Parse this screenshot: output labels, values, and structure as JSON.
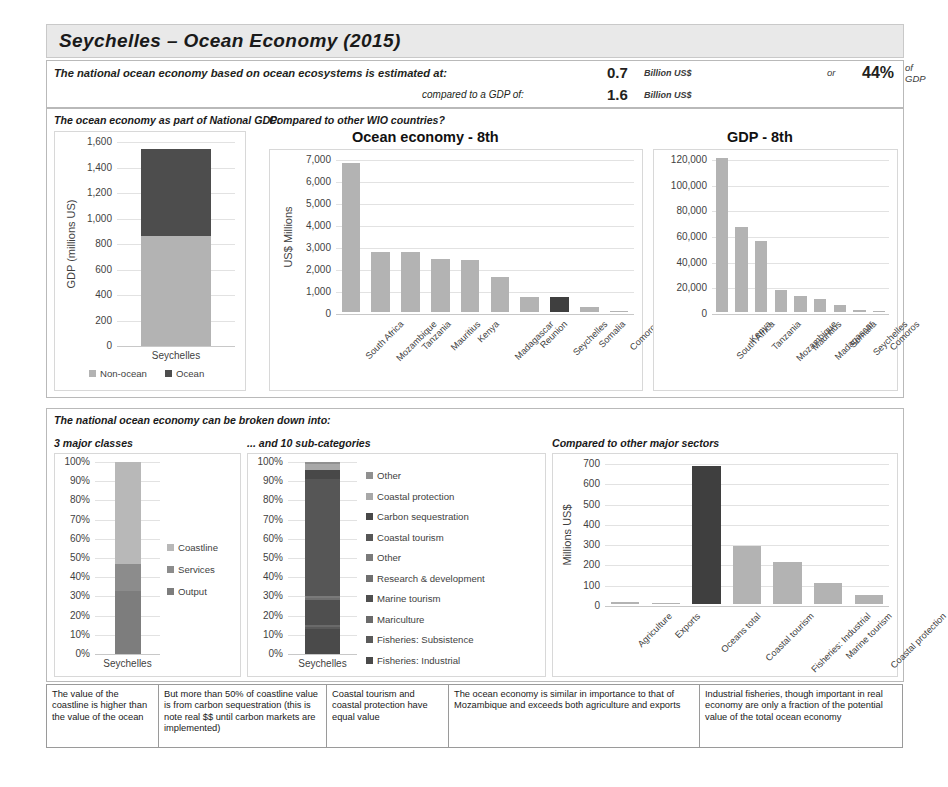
{
  "header": {
    "title": "Seychelles  –  Ocean Economy (2015)"
  },
  "summary": {
    "line1_label": "The national ocean economy based on ocean ecosystems is estimated at:",
    "line1_value": "0.7",
    "line1_unit": "Billion US$",
    "line2_label": "compared to a GDP of:",
    "line2_value": "1.6",
    "line2_unit": "Billion US$",
    "or_label": "or",
    "pct_value": "44%",
    "pct_unit": "of GDP"
  },
  "top_section": {
    "left_header": "The ocean economy as part of National GDP:",
    "right_header": "Compared to other WIO countries?"
  },
  "bottom_section": {
    "header": "The national ocean economy can be broken down into:",
    "col1_header": "3 major classes",
    "col2_header": "... and 10 sub-categories",
    "col3_header": "Compared to other major sectors"
  },
  "notes": [
    {
      "text": "The value of the coastline is higher than the value of the ocean",
      "width": 112
    },
    {
      "text": "But more than 50% of coastline value is from carbon sequestration (this is note real $$ until carbon markets are implemented)",
      "width": 168
    },
    {
      "text": "Coastal tourism and coastal protection have equal value",
      "width": 122
    },
    {
      "text": "The ocean economy is similar in importance to that of Mozambique and exceeds both agriculture and exports",
      "width": 251
    },
    {
      "text": "Industrial fisheries, though important in real economy are only a fraction of the potential value of the total ocean economy",
      "width": 203
    }
  ],
  "colors": {
    "light": "#b3b3b3",
    "mid": "#8f8f8f",
    "dark": "#4d4d4d",
    "darker": "#3a3a3a",
    "highlight": "#3f3f3f",
    "verylight": "#c9c9c9"
  },
  "chart_data": [
    {
      "id": "gdp-stack",
      "type": "bar",
      "stacked": true,
      "title": "",
      "xlabel": "",
      "ylabel": "GDP (millions US)",
      "ylim": [
        0,
        1600
      ],
      "yticks": [
        "0",
        "200",
        "400",
        "600",
        "800",
        "1,000",
        "1,200",
        "1,400",
        "1,600"
      ],
      "categories": [
        "Seychelles"
      ],
      "series": [
        {
          "name": "Non-ocean",
          "values": [
            862
          ],
          "color": "#b3b3b3"
        },
        {
          "name": "Ocean",
          "values": [
            683
          ],
          "color": "#4d4d4d"
        }
      ],
      "legend": [
        "Non-ocean",
        "Ocean"
      ],
      "legend_position": "bottom",
      "grid": true
    },
    {
      "id": "ocean-economy-wio",
      "type": "bar",
      "title": "Ocean economy - 8th",
      "xlabel": "",
      "ylabel": "US$ Millions",
      "ylim": [
        0,
        7000
      ],
      "yticks": [
        "0",
        "1,000",
        "2,000",
        "3,000",
        "4,000",
        "5,000",
        "6,000",
        "7,000"
      ],
      "categories": [
        "South Africa",
        "Mozambique",
        "Tanzania",
        "Mauritius",
        "Kenya",
        "Madagascar",
        "Reunion",
        "Seychelles",
        "Somalia",
        "Comoros"
      ],
      "values": [
        6760,
        2720,
        2720,
        2400,
        2370,
        1580,
        700,
        680,
        250,
        60
      ],
      "highlight_index": 7,
      "grid": true
    },
    {
      "id": "gdp-wio",
      "type": "bar",
      "title": "GDP - 8th",
      "xlabel": "",
      "ylabel": "",
      "ylim": [
        0,
        120000
      ],
      "yticks": [
        "0",
        "20,000",
        "40,000",
        "60,000",
        "80,000",
        "100,000",
        "120,000"
      ],
      "categories": [
        "South Africa",
        "Kenya",
        "Tanzania",
        "Mozambique",
        "Mauritius",
        "Madagascar",
        "Somalia",
        "Seychelles",
        "Comoros"
      ],
      "values": [
        125000,
        66000,
        55000,
        17000,
        12500,
        10500,
        5500,
        1600,
        600
      ],
      "grid": true
    },
    {
      "id": "three-major-classes",
      "type": "bar",
      "stacked": true,
      "title": "",
      "xlabel": "",
      "ylabel": "",
      "ylim": [
        0,
        100
      ],
      "yticks": [
        "0%",
        "10%",
        "20%",
        "30%",
        "40%",
        "50%",
        "60%",
        "70%",
        "80%",
        "90%",
        "100%"
      ],
      "categories": [
        "Seychelles"
      ],
      "series": [
        {
          "name": "Output",
          "values": [
            33
          ],
          "color": "#7d7d7d"
        },
        {
          "name": "Services",
          "values": [
            14
          ],
          "color": "#8c8c8c"
        },
        {
          "name": "Coastline",
          "values": [
            53
          ],
          "color": "#b8b8b8"
        }
      ],
      "legend": [
        "Coastline",
        "Services",
        "Output"
      ],
      "legend_position": "right",
      "grid": true
    },
    {
      "id": "ten-sub-categories",
      "type": "bar",
      "stacked": true,
      "title": "",
      "xlabel": "",
      "ylabel": "",
      "ylim": [
        0,
        100
      ],
      "yticks": [
        "0%",
        "10%",
        "20%",
        "30%",
        "40%",
        "50%",
        "60%",
        "70%",
        "80%",
        "90%",
        "100%"
      ],
      "categories": [
        "Seychelles"
      ],
      "series": [
        {
          "name": "Fisheries: Industrial",
          "values": [
            13
          ],
          "color": "#4a4a4a"
        },
        {
          "name": "Fisheries: Subsistence",
          "values": [
            1
          ],
          "color": "#5a5a5a"
        },
        {
          "name": "Mariculture",
          "values": [
            1
          ],
          "color": "#6a6a6a"
        },
        {
          "name": "Marine tourism",
          "values": [
            13
          ],
          "color": "#4f4f4f"
        },
        {
          "name": "Research & development",
          "values": [
            1
          ],
          "color": "#6f6f6f"
        },
        {
          "name": "Other",
          "values": [
            1
          ],
          "color": "#7a7a7a"
        },
        {
          "name": "Coastal tourism",
          "values": [
            61
          ],
          "color": "#565656"
        },
        {
          "name": "Carbon sequestration",
          "values": [
            5
          ],
          "color": "#484848"
        },
        {
          "name": "Coastal protection",
          "values": [
            3
          ],
          "color": "#a8a8a8"
        },
        {
          "name": "Other",
          "values": [
            1
          ],
          "color": "#909090"
        }
      ],
      "legend": [
        "Other",
        "Coastal protection",
        "Carbon sequestration",
        "Coastal tourism",
        "Other",
        "Research & development",
        "Marine tourism",
        "Mariculture",
        "Fisheries: Subsistence",
        "Fisheries: Industrial"
      ],
      "legend_colors": [
        "#909090",
        "#a8a8a8",
        "#484848",
        "#565656",
        "#7a7a7a",
        "#6f6f6f",
        "#4f4f4f",
        "#6a6a6a",
        "#5a5a5a",
        "#4a4a4a"
      ],
      "legend_position": "right",
      "grid": true
    },
    {
      "id": "major-sectors",
      "type": "bar",
      "title": "",
      "xlabel": "",
      "ylabel": "Millions US$",
      "ylim": [
        0,
        700
      ],
      "yticks": [
        "0",
        "100",
        "200",
        "300",
        "400",
        "500",
        "600",
        "700"
      ],
      "categories": [
        "Agriculture",
        "Exports",
        "Oceans total",
        "Coastal tourism",
        "Fisheries: Industrial",
        "Marine tourism",
        "Coastal protection"
      ],
      "values": [
        10,
        0,
        680,
        285,
        205,
        105,
        45
      ],
      "highlight_index": 2,
      "grid": true
    }
  ]
}
